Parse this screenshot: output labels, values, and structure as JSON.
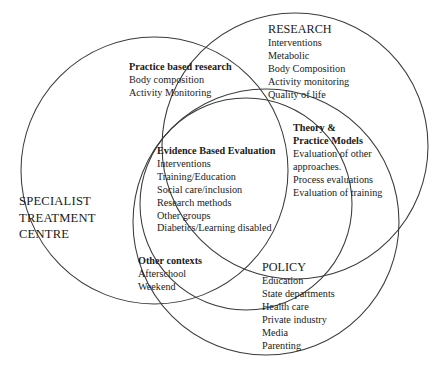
{
  "diagram": {
    "type": "venn-diagram",
    "stroke_color": "#3b3b3b",
    "background_color": "#ffffff",
    "text_color": "#1a1a1a"
  },
  "circles": [
    {
      "name": "specialist-treatment-centre",
      "cx": 154.5,
      "cy": 170.5,
      "r": 133.5
    },
    {
      "name": "research",
      "cx": 295.0,
      "cy": 146.0,
      "r": 133.0
    },
    {
      "name": "policy",
      "cx": 266.0,
      "cy": 222.0,
      "r": 133.0
    },
    {
      "name": "evidence-based-evaluation",
      "cx": 246.0,
      "cy": 204.0,
      "r": 106.0
    }
  ],
  "regions": {
    "specialist_treatment_centre": {
      "heading_lines": [
        "SPECIALIST",
        "TREATMENT",
        "CENTRE"
      ]
    },
    "practice_based_research": {
      "heading": "Practice based research",
      "items": [
        "Body composition",
        "Activity Monitoring"
      ]
    },
    "research": {
      "heading": "RESEARCH",
      "items": [
        "Interventions",
        "Metabolic",
        "Body Composition",
        "Activity monitoring",
        "Quality of life"
      ]
    },
    "evidence_based_evaluation": {
      "heading": "Evidence Based Evaluation",
      "items": [
        "Interventions",
        "Training/Education",
        "Social care/inclusion",
        "Research methods",
        "Other groups",
        "Diabetics/Learning disabled"
      ]
    },
    "theory_and_practice_models": {
      "heading_line1": "Theory &",
      "heading_line2": "Practice Models",
      "items": [
        "Evaluation of other",
        "approaches.",
        "Process evaluations",
        "Evaluation of training"
      ]
    },
    "other_contexts": {
      "heading": "Other contexts",
      "items": [
        "Afterschool",
        "Weekend"
      ]
    },
    "policy": {
      "heading": "POLICY",
      "items": [
        "Education",
        "State departments",
        "Health care",
        "Private industry",
        "Media",
        "Parenting"
      ]
    }
  }
}
